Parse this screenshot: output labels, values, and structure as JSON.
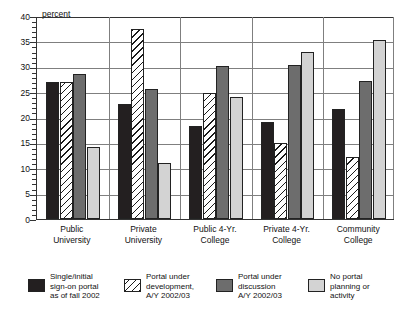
{
  "chart_data": {
    "type": "bar",
    "title": "",
    "xlabel": "",
    "ylabel": "percent",
    "ylim": [
      0,
      40
    ],
    "ytick_step": 5,
    "yticks": [
      0,
      5,
      10,
      15,
      20,
      25,
      30,
      35,
      40
    ],
    "minor_tick_step": 1,
    "grid": true,
    "legend_position": "bottom",
    "categories": [
      "Public\nUniversity",
      "Private\nUniversity",
      "Public 4-Yr.\nCollege",
      "Private 4-Yr.\nCollege",
      "Community\nCollege"
    ],
    "series": [
      {
        "name": "Single/initial\nsign-on portal\nas of  fall 2002",
        "style": "solid-black",
        "color": "#231f20",
        "values": [
          27.0,
          22.6,
          18.3,
          19.2,
          21.7
        ]
      },
      {
        "name": "Portal under\ndevelopment,\nA/Y 2002/03",
        "style": "diagonal-hatch",
        "color": "#ffffff",
        "values": [
          27.0,
          37.5,
          24.8,
          15.0,
          12.3
        ]
      },
      {
        "name": "Portal under\ndiscussion\nA/Y 2002/03",
        "style": "solid-dark-gray",
        "color": "#6d6d6d",
        "values": [
          28.5,
          25.7,
          30.2,
          30.3,
          27.2
        ]
      },
      {
        "name": "No portal\nplanning or\nactivity",
        "style": "solid-light-gray",
        "color": "#d3d3d3",
        "values": [
          14.1,
          11.0,
          24.0,
          33.0,
          35.3
        ]
      }
    ]
  },
  "axis": {
    "unit_label": "percent",
    "tick_labels": [
      "0",
      "5",
      "10",
      "15",
      "20",
      "25",
      "30",
      "35",
      "40"
    ]
  },
  "legend": {
    "items": [
      {
        "label": "Single/initial\nsign-on portal\nas of  fall 2002"
      },
      {
        "label": "Portal under\ndevelopment,\nA/Y 2002/03"
      },
      {
        "label": "Portal under\ndiscussion\nA/Y 2002/03"
      },
      {
        "label": "No portal\nplanning or\nactivity"
      }
    ]
  }
}
